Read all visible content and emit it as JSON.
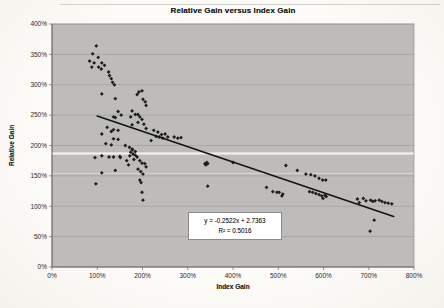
{
  "chart": {
    "title": "Relative Gain versus Index Gain",
    "equation_line1": "y = -0.2522x + 2.7363",
    "equation_line2": "R² = 0.5016"
  },
  "chart_data": {
    "type": "scatter",
    "title": "Relative Gain versus Index Gain",
    "xlabel": "Index Gain",
    "ylabel": "Relative Gain",
    "xlim_percent": [
      0,
      800
    ],
    "ylim_percent": [
      0,
      400
    ],
    "x_tick_step_percent": 100,
    "y_tick_step_percent": 50,
    "x_ticks": [
      "0%",
      "100%",
      "200%",
      "300%",
      "400%",
      "500%",
      "600%",
      "700%",
      "800%"
    ],
    "y_ticks": [
      "0%",
      "50%",
      "100%",
      "150%",
      "200%",
      "250%",
      "300%",
      "350%",
      "400%"
    ],
    "grid": "horizontal-major-only",
    "legend": "none",
    "marker_style": "small-black-diamond",
    "marker_color": "#1c1c1c",
    "plot_bg_color": "#bdbcba",
    "gridline_color": "#9c9b98",
    "points_percent": [
      [
        98,
        364
      ],
      [
        90,
        351
      ],
      [
        102,
        345
      ],
      [
        83,
        339
      ],
      [
        93,
        336
      ],
      [
        110,
        336
      ],
      [
        116,
        332
      ],
      [
        88,
        329
      ],
      [
        103,
        329
      ],
      [
        109,
        326
      ],
      [
        125,
        321
      ],
      [
        127,
        315
      ],
      [
        131,
        310
      ],
      [
        134,
        304
      ],
      [
        138,
        300
      ],
      [
        110,
        285
      ],
      [
        140,
        277
      ],
      [
        146,
        256
      ],
      [
        153,
        250
      ],
      [
        140,
        246
      ],
      [
        192,
        288
      ],
      [
        199,
        290
      ],
      [
        188,
        284
      ],
      [
        201,
        276
      ],
      [
        206,
        272
      ],
      [
        208,
        266
      ],
      [
        177,
        257
      ],
      [
        184,
        251
      ],
      [
        190,
        251
      ],
      [
        174,
        247
      ],
      [
        194,
        247
      ],
      [
        199,
        243
      ],
      [
        190,
        238
      ],
      [
        203,
        235
      ],
      [
        177,
        234
      ],
      [
        208,
        228
      ],
      [
        225,
        225
      ],
      [
        234,
        222
      ],
      [
        242,
        218
      ],
      [
        250,
        219
      ],
      [
        230,
        215
      ],
      [
        237,
        214
      ],
      [
        256,
        214
      ],
      [
        270,
        214
      ],
      [
        278,
        212
      ],
      [
        285,
        213
      ],
      [
        219,
        208
      ],
      [
        245,
        212
      ],
      [
        136,
        247
      ],
      [
        122,
        230
      ],
      [
        136,
        226
      ],
      [
        146,
        225
      ],
      [
        131,
        223
      ],
      [
        110,
        219
      ],
      [
        136,
        211
      ],
      [
        146,
        210
      ],
      [
        119,
        203
      ],
      [
        131,
        201
      ],
      [
        162,
        200
      ],
      [
        171,
        197
      ],
      [
        178,
        193
      ],
      [
        184,
        190
      ],
      [
        110,
        183
      ],
      [
        136,
        181
      ],
      [
        151,
        180
      ],
      [
        95,
        180
      ],
      [
        126,
        181
      ],
      [
        150,
        182
      ],
      [
        165,
        175
      ],
      [
        169,
        168
      ],
      [
        140,
        159
      ],
      [
        110,
        155
      ],
      [
        97,
        137
      ],
      [
        177,
        194
      ],
      [
        174,
        189
      ],
      [
        179,
        186
      ],
      [
        172,
        183
      ],
      [
        184,
        184
      ],
      [
        188,
        181
      ],
      [
        181,
        177
      ],
      [
        194,
        175
      ],
      [
        199,
        171
      ],
      [
        205,
        170
      ],
      [
        208,
        165
      ],
      [
        190,
        161
      ],
      [
        196,
        157
      ],
      [
        201,
        153
      ],
      [
        194,
        143
      ],
      [
        197,
        139
      ],
      [
        199,
        123
      ],
      [
        201,
        110
      ],
      [
        342,
        172
      ],
      [
        340,
        168
      ],
      [
        344,
        170
      ],
      [
        338,
        170
      ],
      [
        400,
        172
      ],
      [
        344,
        133
      ],
      [
        474,
        131
      ],
      [
        517,
        167
      ],
      [
        542,
        159
      ],
      [
        561,
        153
      ],
      [
        572,
        152
      ],
      [
        581,
        150
      ],
      [
        590,
        146
      ],
      [
        598,
        143
      ],
      [
        605,
        143
      ],
      [
        488,
        124
      ],
      [
        497,
        123
      ],
      [
        502,
        123
      ],
      [
        508,
        117
      ],
      [
        510,
        120
      ],
      [
        569,
        124
      ],
      [
        576,
        123
      ],
      [
        583,
        121
      ],
      [
        590,
        119
      ],
      [
        596,
        117
      ],
      [
        599,
        113
      ],
      [
        603,
        118
      ],
      [
        606,
        116
      ],
      [
        675,
        112
      ],
      [
        679,
        106
      ],
      [
        688,
        113
      ],
      [
        694,
        109
      ],
      [
        704,
        110
      ],
      [
        709,
        108
      ],
      [
        714,
        109
      ],
      [
        723,
        110
      ],
      [
        729,
        108
      ],
      [
        736,
        106
      ],
      [
        743,
        105
      ],
      [
        751,
        104
      ],
      [
        712,
        77
      ],
      [
        703,
        59
      ]
    ],
    "trendline": {
      "slope": -0.2522,
      "intercept": 2.7363,
      "equation_text": "y = -0.2522x + 2.7363",
      "r_squared_text": "R² = 0.5016",
      "x_range_percent": [
        100,
        755
      ],
      "color": "#141414"
    }
  }
}
